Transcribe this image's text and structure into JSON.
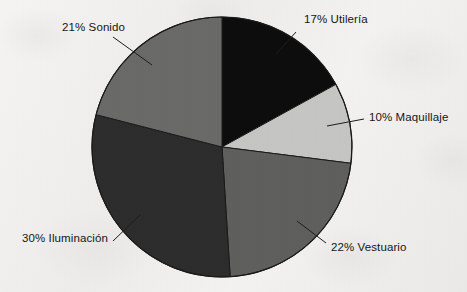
{
  "chart_data": {
    "type": "pie",
    "title": "",
    "subtitle": "",
    "xlabel": "",
    "ylabel": "",
    "legend_position": "none",
    "grid": false,
    "labels_show_percent": true,
    "start_angle_deg": 0,
    "direction": "clockwise",
    "categories": [
      "Utilería",
      "Maquillaje",
      "Vestuario",
      "Iluminación",
      "Sonido"
    ],
    "values": [
      17,
      10,
      22,
      30,
      21
    ],
    "unit": "%",
    "slices": [
      {
        "label": "17% Utilería",
        "name": "Utilería",
        "value": 17,
        "color": "#0d0d0d",
        "start_deg": 0,
        "end_deg": 61.2,
        "label_x": 304,
        "label_y": 14,
        "leader": {
          "x1": 296,
          "y1": 32,
          "x2": 276,
          "y2": 54
        }
      },
      {
        "label": "10% Maquillaje",
        "name": "Maquillaje",
        "value": 10,
        "color": "#c6c6c4",
        "start_deg": 61.2,
        "end_deg": 97.2,
        "label_x": 369,
        "label_y": 112,
        "leader": {
          "x1": 364,
          "y1": 119,
          "x2": 327,
          "y2": 126
        }
      },
      {
        "label": "22% Vestuario",
        "name": "Vestuario",
        "value": 22,
        "color": "#5f5f5e",
        "start_deg": 97.2,
        "end_deg": 176.4,
        "label_x": 331,
        "label_y": 242,
        "leader": {
          "x1": 326,
          "y1": 243,
          "x2": 297,
          "y2": 221
        }
      },
      {
        "label": "30% Iluminación",
        "name": "Iluminación",
        "value": 30,
        "color": "#2d2d2d",
        "start_deg": 176.4,
        "end_deg": 284.4,
        "label_x": 22,
        "label_y": 233,
        "leader": {
          "x1": 113,
          "y1": 241,
          "x2": 140,
          "y2": 215
        }
      },
      {
        "label": "21% Sonido",
        "name": "Sonido",
        "value": 21,
        "color": "#6a6a69",
        "start_deg": 284.4,
        "end_deg": 360,
        "label_x": 62,
        "label_y": 22,
        "leader": {
          "x1": 113,
          "y1": 37,
          "x2": 152,
          "y2": 65
        }
      }
    ],
    "geometry": {
      "center_x": 222,
      "center_y": 147,
      "radius": 130
    },
    "colors": {
      "background": "#f1f0ee",
      "outline": "#1a1a1a",
      "text": "#161616"
    }
  }
}
